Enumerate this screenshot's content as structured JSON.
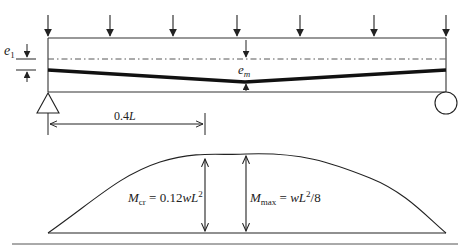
{
  "figure": {
    "beam": {
      "eccentricity_end_label": {
        "symbol": "e",
        "subscript": "1"
      },
      "eccentricity_mid_label": {
        "symbol": "e",
        "subscript": "m"
      },
      "distance_label": {
        "value": "0.4",
        "var": "L"
      },
      "num_load_arrows": 7,
      "left_support": "pin-triangle",
      "right_support": "roller-circle"
    },
    "moment_diagram": {
      "cracking_moment": {
        "symbol": "M",
        "subscript": "cr",
        "equals": " = 0.12",
        "w": "w",
        "L": "L",
        "power": "2",
        "tail": ""
      },
      "max_moment": {
        "symbol": "M",
        "subscript": "max",
        "equals": " = ",
        "w": "w",
        "L": "L",
        "power": "2",
        "tail": "/8"
      }
    },
    "colors": {
      "line": "#2a2a2a",
      "tendon": "#111111",
      "background": "#ffffff"
    }
  }
}
